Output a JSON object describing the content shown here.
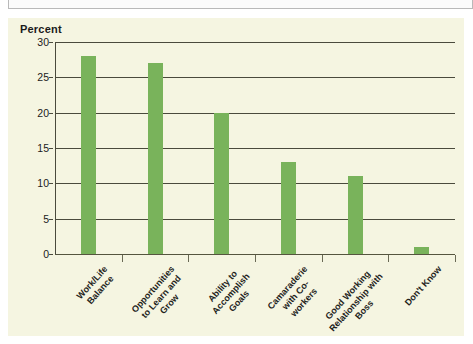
{
  "chart_data": {
    "type": "bar",
    "title": "",
    "subtitle": "",
    "xlabel": "",
    "ylabel": "Percent",
    "ylim": [
      0,
      30
    ],
    "yticks": [
      0,
      5,
      10,
      15,
      20,
      25,
      30
    ],
    "ytick_labels": [
      "0",
      "5",
      "10",
      "15",
      "20",
      "25",
      "30"
    ],
    "grid": true,
    "legend": null,
    "categories": [
      "Work/Life Balance",
      "Opportunities to Learn and Grow",
      "Ability to Accomplish Goals",
      "Camaraderie with Co-workers",
      "Good Working Relationship with Boss",
      "Don't Know"
    ],
    "category_lines": [
      [
        "Work/Life",
        "Balance"
      ],
      [
        "Opportunities",
        "to Learn and",
        "Grow"
      ],
      [
        "Ability to",
        "Accomplish",
        "Goals"
      ],
      [
        "Camaraderie",
        "with Co-",
        "workers"
      ],
      [
        "Good Working",
        "Relationship with",
        "Boss"
      ],
      [
        "Don't Know"
      ]
    ],
    "values": [
      28,
      27,
      20,
      13,
      11,
      1
    ],
    "bar_color": "#79b35b",
    "plot_background": "#f5f5e1",
    "axis_color": "#4a4a3c"
  }
}
